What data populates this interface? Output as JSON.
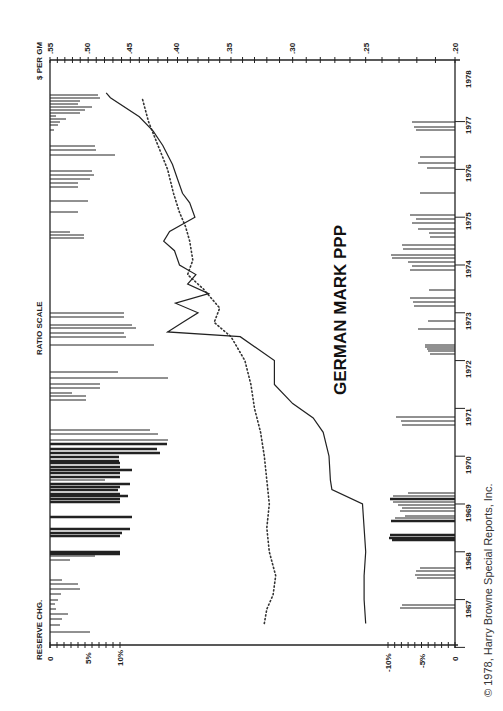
{
  "chart_data": {
    "type": "line",
    "title": "GERMAN MARK PPP",
    "orientation": "rotated 90 degrees counter-clockwise (time runs bottom to top, value axis on top)",
    "ylabel": "$ PER GM",
    "yscale": "RATIO SCALE",
    "ylim": [
      0.2,
      0.55
    ],
    "y_ticks": [
      ".55",
      ".50",
      ".45",
      ".40",
      ".35",
      ".30",
      ".25",
      ".20"
    ],
    "xlabel": "Year",
    "x_ticks": [
      "1967",
      "1968",
      "1969",
      "1970",
      "1971",
      "1972",
      "1973",
      "1974",
      "1975",
      "1976",
      "1977",
      "1978"
    ],
    "series": [
      {
        "name": "Exchange rate ($ per GM)",
        "style": "solid",
        "x": [
          1967.0,
          1967.5,
          1968.0,
          1968.5,
          1969.0,
          1969.5,
          1969.8,
          1970.0,
          1970.5,
          1971.0,
          1971.3,
          1971.6,
          1972.0,
          1972.5,
          1973.0,
          1973.1,
          1973.3,
          1973.5,
          1973.7,
          1973.9,
          1974.1,
          1974.3,
          1974.5,
          1974.8,
          1975.0,
          1975.2,
          1975.5,
          1975.8,
          1976.0,
          1976.3,
          1976.6,
          1977.0,
          1977.3,
          1977.6,
          1978.0,
          1978.1
        ],
        "values": [
          0.25,
          0.251,
          0.251,
          0.25,
          0.251,
          0.252,
          0.272,
          0.273,
          0.274,
          0.278,
          0.285,
          0.3,
          0.314,
          0.314,
          0.342,
          0.41,
          0.395,
          0.38,
          0.402,
          0.37,
          0.39,
          0.382,
          0.398,
          0.403,
          0.414,
          0.408,
          0.383,
          0.388,
          0.395,
          0.4,
          0.405,
          0.415,
          0.425,
          0.44,
          0.473,
          0.478
        ]
      },
      {
        "name": "Purchasing power parity",
        "style": "dotted",
        "x": [
          1967.0,
          1967.3,
          1967.6,
          1968.0,
          1968.5,
          1969.0,
          1969.5,
          1970.0,
          1970.5,
          1971.0,
          1971.5,
          1972.0,
          1972.5,
          1973.0,
          1973.3,
          1973.6,
          1974.0,
          1974.3,
          1974.6,
          1975.0,
          1975.3,
          1975.6,
          1976.0,
          1976.5,
          1977.0,
          1977.5,
          1978.0
        ],
        "values": [
          0.322,
          0.32,
          0.315,
          0.313,
          0.318,
          0.32,
          0.318,
          0.32,
          0.322,
          0.325,
          0.33,
          0.333,
          0.338,
          0.35,
          0.365,
          0.36,
          0.375,
          0.39,
          0.385,
          0.388,
          0.392,
          0.398,
          0.404,
          0.41,
          0.42,
          0.43,
          0.437
        ]
      }
    ],
    "reserve_change": {
      "label": "RESERVE CHG.",
      "positive_axis": {
        "ticks": [
          "0",
          "5%",
          "10%"
        ],
        "side": "left"
      },
      "negative_axis": {
        "ticks": [
          "-10%",
          "-5%",
          "0"
        ],
        "side": "right"
      },
      "note": "Horizontal bars: monthly changes in German reserves; positive bars from left axis, negative bars from right axis"
    },
    "grid": false,
    "legend": null,
    "annotation": "© 1978, Harry Browne Special Reports, Inc."
  },
  "labels": {
    "title": "GERMAN MARK PPP",
    "top_axis_label": "$ PER GM",
    "scale_label": "RATIO SCALE",
    "reserve_label": "RESERVE CHG.",
    "copyright": "© 1978, Harry Browne Special Reports, Inc.",
    "top_ticks": [
      ".55",
      ".50",
      ".45",
      ".40",
      ".35",
      ".30",
      ".25",
      ".20"
    ],
    "years": [
      "1978",
      "1977",
      "1976",
      "1975",
      "1974",
      "1973",
      "1972",
      "1971",
      "1970",
      "1969",
      "1968",
      "1967"
    ],
    "left_reserve_ticks": [
      "0",
      "5%",
      "10%"
    ],
    "right_reserve_ticks": [
      "-10%",
      "-5%",
      "0"
    ]
  }
}
